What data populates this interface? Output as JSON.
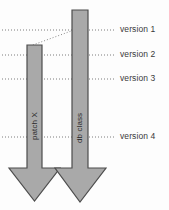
{
  "diagram": {
    "background_color": "#fdfdfd",
    "arrow_fill": "#a9a9a9",
    "arrow_stroke": "#4d4d4d",
    "dotted_line_color": "#7d7d7d",
    "label_color": "#3a3a3a"
  },
  "versions": [
    {
      "label": "version 1",
      "y": 30
    },
    {
      "label": "version 2",
      "y": 55
    },
    {
      "label": "version 3",
      "y": 79
    },
    {
      "label": "version 4",
      "y": 137
    }
  ],
  "arrows": [
    {
      "label": "patch X",
      "shaft_left": 27,
      "shaft_right": 42,
      "top": 45,
      "head_top": 168,
      "head_left": 9,
      "head_right": 60,
      "tip_y": 201
    },
    {
      "label": "db class",
      "shaft_left": 72,
      "shaft_right": 88,
      "top": 10,
      "head_top": 168,
      "head_left": 55,
      "head_right": 106,
      "tip_y": 202
    }
  ],
  "connector": {
    "name": "patch-origin-connector",
    "from_x": 34,
    "from_y": 45,
    "to_x": 72,
    "to_y": 30
  }
}
